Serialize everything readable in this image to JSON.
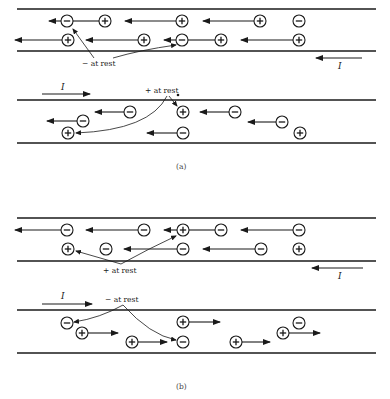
{
  "figure": {
    "panels": [
      {
        "id": "a",
        "caption": "(a)",
        "top_wire": {
          "lines_y": [
            9,
            51
          ],
          "current_label": "I",
          "current_direction": "left",
          "rest_label": "− at rest",
          "charges": [
            {
              "sign": "-",
              "x": 67,
              "y": 21,
              "arrow_to": 49
            },
            {
              "sign": "+",
              "x": 105,
              "y": 21,
              "arrow_to": 73,
              "arrow_head": false
            },
            {
              "sign": "+",
              "x": 182,
              "y": 21,
              "arrow_to": 125
            },
            {
              "sign": "+",
              "x": 260,
              "y": 21,
              "arrow_to": 203
            },
            {
              "sign": "-",
              "x": 299,
              "y": 21
            },
            {
              "sign": "+",
              "x": 68,
              "y": 40,
              "arrow_to": 15
            },
            {
              "sign": "+",
              "x": 144,
              "y": 40,
              "arrow_to": 86
            },
            {
              "sign": "-",
              "x": 182,
              "y": 40,
              "arrow_to": 164
            },
            {
              "sign": "+",
              "x": 221,
              "y": 40,
              "arrow_to": 188,
              "arrow_head": false
            },
            {
              "sign": "+",
              "x": 299,
              "y": 40,
              "arrow_to": 241
            }
          ]
        },
        "bottom_wire": {
          "lines_y": [
            100,
            143
          ],
          "current_label": "I",
          "current_direction": "right",
          "rest_label": "+ at rest",
          "charges": [
            {
              "sign": "-",
              "x": 130,
              "y": 112,
              "arrow_to": 95
            },
            {
              "sign": "+",
              "x": 183,
              "y": 112
            },
            {
              "sign": "-",
              "x": 235,
              "y": 112,
              "arrow_to": 200
            },
            {
              "sign": "-",
              "x": 83,
              "y": 121,
              "arrow_to": 47
            },
            {
              "sign": "-",
              "x": 282,
              "y": 122,
              "arrow_to": 248
            },
            {
              "sign": "+",
              "x": 68,
              "y": 133
            },
            {
              "sign": "-",
              "x": 183,
              "y": 133,
              "arrow_to": 147
            },
            {
              "sign": "+",
              "x": 300,
              "y": 133
            }
          ]
        }
      },
      {
        "id": "b",
        "caption": "(b)",
        "top_wire": {
          "lines_y": [
            218,
            261
          ],
          "current_label": "I",
          "current_direction": "left",
          "rest_label": "+ at rest",
          "charges": [
            {
              "sign": "-",
              "x": 67,
              "y": 230,
              "arrow_to": 15
            },
            {
              "sign": "-",
              "x": 144,
              "y": 230,
              "arrow_to": 86
            },
            {
              "sign": "+",
              "x": 183,
              "y": 230,
              "arrow_to": 164
            },
            {
              "sign": "-",
              "x": 221,
              "y": 230,
              "arrow_to": 189,
              "arrow_head": false
            },
            {
              "sign": "-",
              "x": 299,
              "y": 230,
              "arrow_to": 241
            },
            {
              "sign": "+",
              "x": 68,
              "y": 249
            },
            {
              "sign": "-",
              "x": 106,
              "y": 249
            },
            {
              "sign": "-",
              "x": 183,
              "y": 249,
              "arrow_to": 124
            },
            {
              "sign": "-",
              "x": 261,
              "y": 249,
              "arrow_to": 203
            },
            {
              "sign": "+",
              "x": 299,
              "y": 249
            }
          ]
        },
        "bottom_wire": {
          "lines_y": [
            310,
            353
          ],
          "current_label": "I",
          "current_direction": "right",
          "rest_label": "− at rest",
          "charges": [
            {
              "sign": "-",
              "x": 67,
              "y": 323
            },
            {
              "sign": "+",
              "x": 82,
              "y": 333,
              "arrow_to": 118
            },
            {
              "sign": "+",
              "x": 183,
              "y": 322,
              "arrow_to": 220
            },
            {
              "sign": "+",
              "x": 132,
              "y": 342,
              "arrow_to": 167
            },
            {
              "sign": "-",
              "x": 183,
              "y": 342
            },
            {
              "sign": "+",
              "x": 236,
              "y": 342,
              "arrow_to": 270
            },
            {
              "sign": "-",
              "x": 299,
              "y": 323
            },
            {
              "sign": "+",
              "x": 283,
              "y": 333,
              "arrow_to": 320
            }
          ]
        }
      }
    ]
  },
  "labels": {
    "a_minus_rest": "− at rest",
    "a_plus_rest": "+ at rest",
    "b_plus_rest": "+ at rest",
    "b_minus_rest": "− at rest",
    "current": "I",
    "caption_a": "(a)",
    "caption_b": "(b)"
  }
}
